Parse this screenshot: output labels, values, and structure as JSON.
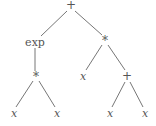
{
  "diagram": {
    "type": "expression-tree",
    "line_color": "#666666",
    "nodes": [
      {
        "id": "n0",
        "label": "+",
        "kind": "op",
        "x": 71,
        "y": 5
      },
      {
        "id": "n1",
        "label": "exp",
        "kind": "fn",
        "x": 35,
        "y": 42
      },
      {
        "id": "n2",
        "label": "*",
        "kind": "op",
        "x": 105,
        "y": 40
      },
      {
        "id": "n3",
        "label": "*",
        "kind": "op",
        "x": 36,
        "y": 76
      },
      {
        "id": "n4",
        "label": "x",
        "kind": "var",
        "x": 83,
        "y": 76
      },
      {
        "id": "n5",
        "label": "+",
        "kind": "op",
        "x": 127,
        "y": 76
      },
      {
        "id": "n6",
        "label": "x",
        "kind": "var",
        "x": 14,
        "y": 113
      },
      {
        "id": "n7",
        "label": "x",
        "kind": "var",
        "x": 57,
        "y": 113
      },
      {
        "id": "n8",
        "label": "x",
        "kind": "var",
        "x": 110,
        "y": 113
      },
      {
        "id": "n9",
        "label": "x",
        "kind": "var",
        "x": 145,
        "y": 113
      }
    ],
    "edges": [
      {
        "from": "n0",
        "to": "n1",
        "x1": 67,
        "y1": 11,
        "x2": 41,
        "y2": 36
      },
      {
        "from": "n0",
        "to": "n2",
        "x1": 75,
        "y1": 11,
        "x2": 102,
        "y2": 35
      },
      {
        "from": "n1",
        "to": "n3",
        "x1": 35,
        "y1": 48,
        "x2": 35,
        "y2": 71
      },
      {
        "from": "n2",
        "to": "n4",
        "x1": 102,
        "y1": 45,
        "x2": 86,
        "y2": 70
      },
      {
        "from": "n2",
        "to": "n5",
        "x1": 108,
        "y1": 45,
        "x2": 125,
        "y2": 70
      },
      {
        "from": "n3",
        "to": "n6",
        "x1": 33,
        "y1": 81,
        "x2": 16,
        "y2": 107
      },
      {
        "from": "n3",
        "to": "n7",
        "x1": 39,
        "y1": 81,
        "x2": 55,
        "y2": 107
      },
      {
        "from": "n5",
        "to": "n8",
        "x1": 125,
        "y1": 82,
        "x2": 112,
        "y2": 107
      },
      {
        "from": "n5",
        "to": "n9",
        "x1": 130,
        "y1": 82,
        "x2": 143,
        "y2": 107
      }
    ]
  }
}
